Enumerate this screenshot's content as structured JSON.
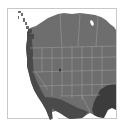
{
  "map": {
    "region": "Western and Central United States with southern Canada and northern Mexico",
    "style": "grayscale choropleth",
    "boundaries": "state/province lines",
    "colors": {
      "background": "#ffffff",
      "frame": "#c8c8c8",
      "land_base": "#6e6e6e",
      "land_dark": "#4a4a4a",
      "land_darker": "#3c3c3c",
      "boundary": "#9a9a9a",
      "water": "#ffffff"
    },
    "shading_zones": [
      {
        "name": "pacific-coast",
        "level": "dark"
      },
      {
        "name": "southwest-mexico",
        "level": "dark"
      },
      {
        "name": "gulf-southeast",
        "level": "darker"
      },
      {
        "name": "interior",
        "level": "base"
      }
    ]
  }
}
